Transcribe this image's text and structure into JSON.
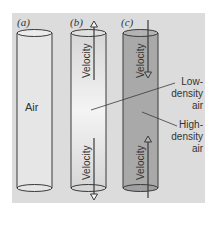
{
  "panels": [
    {
      "label": "(a)",
      "content": "Air"
    },
    {
      "label": "(b)",
      "velocity_top": "Velocity",
      "velocity_bottom": "Velocity"
    },
    {
      "label": "(c)",
      "velocity_top": "Velocity",
      "velocity_bottom": "Velocity"
    }
  ],
  "annotations": {
    "low_density": [
      "Low-",
      "density",
      "air"
    ],
    "high_density": [
      "High-",
      "density",
      "air"
    ]
  },
  "colors": {
    "background": "#dcdcdc",
    "cylinder_a": "#e4e4e4",
    "cylinder_b": "#ececec",
    "cylinder_c": "#a9a9a9",
    "stroke": "#3a3a3a"
  }
}
